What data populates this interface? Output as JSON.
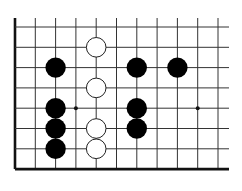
{
  "diagram": {
    "board": {
      "columns": 11,
      "rows": 8,
      "edges": [
        "left",
        "bottom"
      ],
      "colors": {
        "line": "#333333",
        "edge": "#111111",
        "black": "#000000",
        "white": "#ffffff",
        "background": "#ffffff"
      }
    },
    "star_points": [
      {
        "col": 3,
        "row": 4
      },
      {
        "col": 9,
        "row": 4
      }
    ],
    "stones": [
      {
        "color": "white",
        "col": 4,
        "row": 1
      },
      {
        "color": "white",
        "col": 4,
        "row": 3
      },
      {
        "color": "white",
        "col": 4,
        "row": 5
      },
      {
        "color": "white",
        "col": 4,
        "row": 6
      },
      {
        "color": "black",
        "col": 2,
        "row": 2
      },
      {
        "color": "black",
        "col": 6,
        "row": 2
      },
      {
        "color": "black",
        "col": 8,
        "row": 2
      },
      {
        "color": "black",
        "col": 2,
        "row": 4
      },
      {
        "color": "black",
        "col": 2,
        "row": 5
      },
      {
        "color": "black",
        "col": 2,
        "row": 6
      },
      {
        "color": "black",
        "col": 6,
        "row": 4
      },
      {
        "color": "black",
        "col": 6,
        "row": 5
      }
    ]
  }
}
